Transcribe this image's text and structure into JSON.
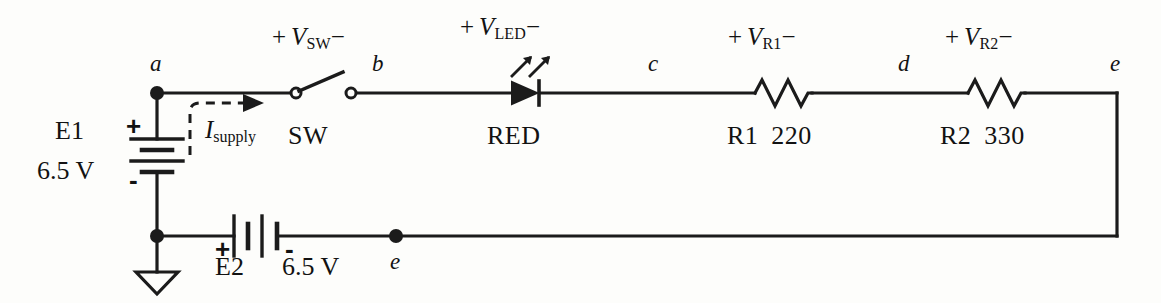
{
  "diagram": {
    "background_color": "#fdfdfb",
    "line_color": "#1b1b1b"
  },
  "nodes": [
    {
      "id": "a",
      "label": "a"
    },
    {
      "id": "b",
      "label": "b"
    },
    {
      "id": "c",
      "label": "c"
    },
    {
      "id": "d",
      "label": "d"
    },
    {
      "id": "e_top",
      "label": "e"
    },
    {
      "id": "e_bottom",
      "label": "e"
    }
  ],
  "sources": {
    "e1": {
      "name": "E1",
      "value": "6.5 V",
      "plus": "+",
      "minus": "-",
      "orientation": "vertical"
    },
    "e2": {
      "name": "E2",
      "value": "6.5 V",
      "plus": "+",
      "minus": "-",
      "orientation": "horizontal"
    }
  },
  "current": {
    "label_symbol": "I",
    "label_subscript": "supply"
  },
  "components": [
    {
      "id": "sw",
      "name": "SW",
      "type": "switch",
      "state": "open",
      "voltage_plus": "+",
      "voltage_symbol": "V",
      "voltage_subscript": "SW",
      "voltage_minus": "−"
    },
    {
      "id": "led",
      "name": "RED",
      "type": "led",
      "voltage_plus": "+",
      "voltage_symbol": "V",
      "voltage_subscript": "LED",
      "voltage_minus": "−"
    },
    {
      "id": "r1",
      "name": "R1",
      "value": "220",
      "type": "resistor",
      "voltage_plus": "+",
      "voltage_symbol": "V",
      "voltage_subscript": "R1",
      "voltage_minus": "−"
    },
    {
      "id": "r2",
      "name": "R2",
      "value": "330",
      "type": "resistor",
      "voltage_plus": "+",
      "voltage_symbol": "V",
      "voltage_subscript": "R2",
      "voltage_minus": "−"
    }
  ],
  "ground": {
    "symbol": "earth-ground"
  }
}
